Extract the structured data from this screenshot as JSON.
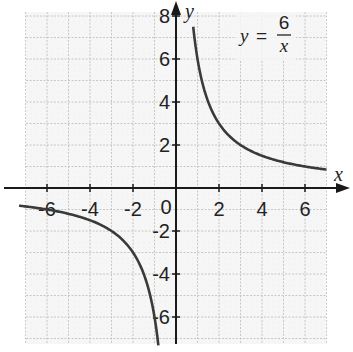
{
  "chart_data": {
    "type": "line",
    "title": "",
    "equation": {
      "lhs": "y",
      "eq": "=",
      "numerator": "6",
      "denominator": "x"
    },
    "xlabel": "x",
    "ylabel": "y",
    "xlim": [
      -7,
      7
    ],
    "ylim": [
      -7.3,
      8.2
    ],
    "grid": true,
    "x_ticks": [
      "-6",
      "-4",
      "-2",
      "0",
      "2",
      "4",
      "6"
    ],
    "y_ticks": [
      "8",
      "6",
      "4",
      "2",
      "-2",
      "-4",
      "-6"
    ],
    "origin_label": "0",
    "series": [
      {
        "name": "y = 6/x (x > 0)",
        "x": [
          0.8,
          1,
          1.5,
          2,
          3,
          4,
          5,
          6,
          7
        ],
        "y": [
          7.5,
          6,
          4,
          3,
          2,
          1.5,
          1.2,
          1,
          0.86
        ]
      },
      {
        "name": "y = 6/x (x < 0)",
        "x": [
          -7.3,
          -6,
          -5,
          -4,
          -3,
          -2,
          -1.5,
          -1,
          -0.82
        ],
        "y": [
          -0.82,
          -1,
          -1.2,
          -1.5,
          -2,
          -3,
          -4,
          -6,
          -7.3
        ]
      }
    ],
    "colors": {
      "curve": "#3a3a3a",
      "axis": "#1a1a1a",
      "grid_major": "#bdbdbd",
      "grid_minor": "#d9d9d9"
    }
  }
}
